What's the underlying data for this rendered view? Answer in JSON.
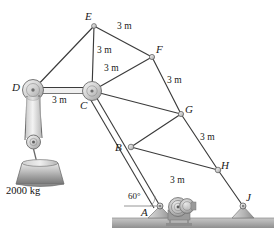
{
  "figure": {
    "type": "statics-truss-crane-diagram",
    "background": "#ffffff",
    "member_color": "#3b3b3b",
    "ground_color": "#b0b0b0",
    "joint_fill": "#d8d8d8"
  },
  "nodes": [
    {
      "id": "E",
      "label": "E",
      "x": 94,
      "y": 26,
      "lx": 85,
      "ly": 11
    },
    {
      "id": "F",
      "label": "F",
      "x": 152,
      "y": 57,
      "lx": 156,
      "ly": 44
    },
    {
      "id": "D",
      "label": "D",
      "x": 33,
      "y": 90,
      "lx": 12,
      "ly": 82
    },
    {
      "id": "C",
      "label": "C",
      "x": 92,
      "y": 91,
      "lx": 80,
      "ly": 100
    },
    {
      "id": "G",
      "label": "G",
      "x": 181,
      "y": 114,
      "lx": 185,
      "ly": 104
    },
    {
      "id": "B",
      "label": "B",
      "x": 131,
      "y": 147,
      "lx": 115,
      "ly": 143
    },
    {
      "id": "H",
      "label": "H",
      "x": 218,
      "y": 170,
      "lx": 221,
      "ly": 160
    },
    {
      "id": "A",
      "label": "A",
      "x": 160,
      "y": 206,
      "lx": 140,
      "ly": 207
    },
    {
      "id": "J",
      "label": "J",
      "x": 243,
      "y": 206,
      "lx": 246,
      "ly": 192
    }
  ],
  "members": [
    {
      "from": "E",
      "to": "D"
    },
    {
      "from": "E",
      "to": "C"
    },
    {
      "from": "E",
      "to": "F"
    },
    {
      "from": "C",
      "to": "F"
    },
    {
      "from": "D",
      "to": "C"
    },
    {
      "from": "F",
      "to": "G"
    },
    {
      "from": "C",
      "to": "G"
    },
    {
      "from": "C",
      "to": "B"
    },
    {
      "from": "B",
      "to": "G"
    },
    {
      "from": "B",
      "to": "H"
    },
    {
      "from": "G",
      "to": "H"
    },
    {
      "from": "H",
      "to": "J"
    },
    {
      "from": "B",
      "to": "A"
    }
  ],
  "dimensions": [
    {
      "text": "3 m",
      "x": 117,
      "y": 26,
      "member": "E-F"
    },
    {
      "text": "3 m",
      "x": 98,
      "y": 50,
      "member": "E-C"
    },
    {
      "text": "3 m",
      "x": 104,
      "y": 68,
      "member": "C-F"
    },
    {
      "text": "3 m",
      "x": 53,
      "y": 97,
      "member": "D-C"
    },
    {
      "text": "3 m",
      "x": 168,
      "y": 81,
      "member": "F-G"
    },
    {
      "text": "3 m",
      "x": 200,
      "y": 137,
      "member": "G-H"
    },
    {
      "text": "3 m",
      "x": 170,
      "y": 178,
      "member": "B-H"
    }
  ],
  "angle": {
    "text": "60°",
    "x": 131,
    "y": 193,
    "at_node": "A"
  },
  "load": {
    "mass_label": "2000 kg",
    "label_x": 6,
    "label_y": 186,
    "cable_from_node": "D",
    "block": {
      "cx": 42,
      "top": 162,
      "bottom": 184,
      "top_w": 40,
      "bottom_w": 54
    }
  },
  "ground": {
    "y_top": 218,
    "y_bottom": 228,
    "x_left": 112,
    "x_right": 274
  },
  "supports": [
    {
      "at_node": "A",
      "x": 160,
      "y": 206,
      "type": "pinned-pedestal"
    },
    {
      "at_node": "J",
      "x": 243,
      "y": 206,
      "type": "pinned-pedestal"
    }
  ],
  "winch": {
    "cx": 178,
    "cy": 208,
    "type": "cable-drum"
  }
}
